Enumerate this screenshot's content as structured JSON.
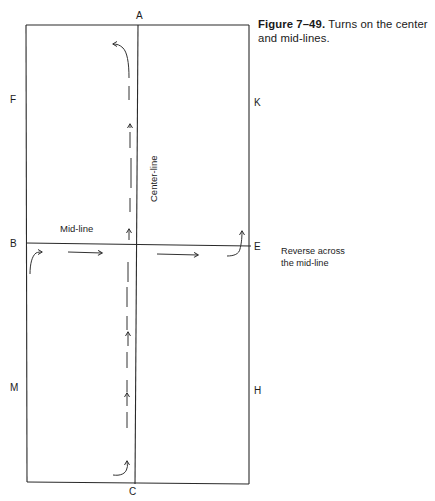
{
  "caption": {
    "figure_number": "Figure 7–49.",
    "text": "Turns on the center and mid-lines."
  },
  "point_labels": {
    "A": "A",
    "B": "B",
    "C": "C",
    "E": "E",
    "F": "F",
    "H": "H",
    "K": "K",
    "M": "M"
  },
  "line_labels": {
    "mid_line": "Mid-line",
    "center_line": "Center-line"
  },
  "annotations": {
    "reverse_line1": "Reverse across",
    "reverse_line2": "the mid-line"
  },
  "colors": {
    "line": "#2a2a2a",
    "path": "#333333",
    "background": "#ffffff"
  }
}
